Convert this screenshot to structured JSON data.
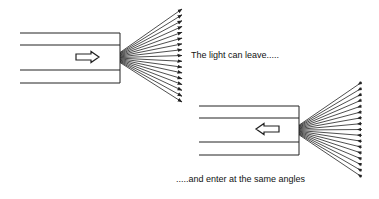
{
  "colors": {
    "line": "#222222",
    "background": "#ffffff",
    "text": "#111111"
  },
  "captions": {
    "leave": "The light can leave.....",
    "enter": ".....and enter at the same angles"
  },
  "diagram": {
    "waveguides": [
      {
        "name": "output-waveguide",
        "x_left": 20,
        "x_right": 120,
        "lines_y": [
          33,
          45,
          70,
          83
        ],
        "direction_arrow": {
          "direction": "right",
          "x": 76,
          "y": 57,
          "length": 23
        },
        "fan": {
          "origin_x": 120,
          "origin_y_top": 45,
          "origin_y_bottom": 70,
          "tip_x": 182,
          "tip_y_top": 9,
          "tip_y_bottom": 102,
          "count": 17,
          "arrowhead": "outward"
        }
      },
      {
        "name": "input-waveguide",
        "x_left": 199,
        "x_right": 299,
        "lines_y": [
          106,
          118,
          142,
          155
        ],
        "direction_arrow": {
          "direction": "left",
          "x": 256,
          "y": 129,
          "length": 23
        },
        "fan": {
          "origin_x": 299,
          "origin_y_top": 118,
          "origin_y_bottom": 142,
          "tip_x": 362,
          "tip_y_top": 82,
          "tip_y_bottom": 177,
          "count": 17,
          "arrowhead": "inward"
        }
      }
    ]
  }
}
